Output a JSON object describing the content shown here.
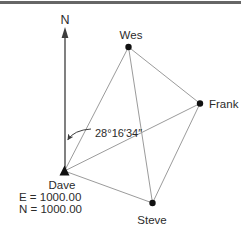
{
  "diagram": {
    "type": "survey-network",
    "north_label": "N",
    "angle_label": "28°16′34″",
    "angle_between": [
      "North line",
      "Dave–Wes line"
    ],
    "stations": [
      {
        "name": "Wes"
      },
      {
        "name": "Frank"
      },
      {
        "name": "Steve"
      },
      {
        "name": "Dave",
        "easting": "E = 1000.00",
        "northing": "N = 1000.00"
      }
    ],
    "edges": [
      [
        "Dave",
        "Wes"
      ],
      [
        "Dave",
        "Frank"
      ],
      [
        "Dave",
        "Steve"
      ],
      [
        "Wes",
        "Frank"
      ],
      [
        "Wes",
        "Steve"
      ],
      [
        "Frank",
        "Steve"
      ]
    ],
    "colors": {
      "edge": "#9b9b9b",
      "ink": "#2b2b2b",
      "arrow": "#3d3d3d",
      "top_border": "#666666"
    }
  }
}
